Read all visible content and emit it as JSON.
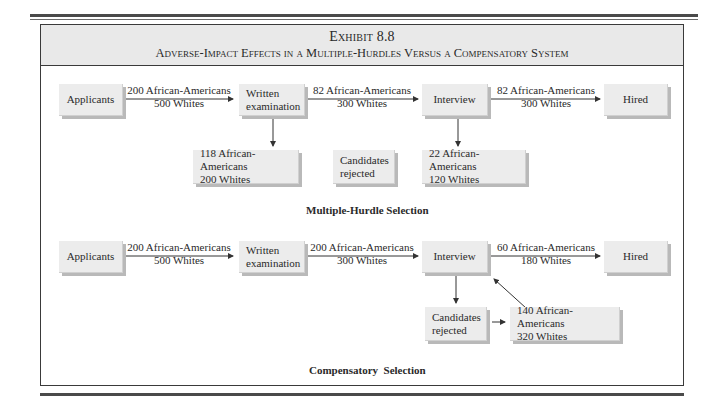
{
  "exhibit": {
    "number": "Exhibit 8.8",
    "title": "Adverse-Impact Effects in a Multiple-Hurdles Versus a Compensatory System"
  },
  "multiple_hurdle": {
    "caption": "Multiple-Hurdle Selection",
    "boxes": {
      "applicants": "Applicants",
      "written_line1": "Written",
      "written_line2": "examination",
      "interview": "Interview",
      "hired": "Hired",
      "rejected_written_line1": "118 African-Americans",
      "rejected_written_line2": "200 Whites",
      "candidates_line1": "Candidates",
      "candidates_line2": "rejected",
      "rejected_interview_line1": "22 African-Americans",
      "rejected_interview_line2": "120 Whites"
    },
    "flows": [
      {
        "line1": "200 African-Americans",
        "line2": "500 Whites"
      },
      {
        "line1": "82 African-Americans",
        "line2": "300 Whites"
      },
      {
        "line1": "82 African-Americans",
        "line2": "300 Whites"
      }
    ]
  },
  "compensatory": {
    "caption": "Compensatory  Selection",
    "boxes": {
      "applicants": "Applicants",
      "written_line1": "Written",
      "written_line2": "examination",
      "interview": "Interview",
      "hired": "Hired",
      "candidates_line1": "Candidates",
      "candidates_line2": "rejected",
      "rejected_line1": "140 African-Americans",
      "rejected_line2": "320 Whites"
    },
    "flows": [
      {
        "line1": "200 African-Americans",
        "line2": "500 Whites"
      },
      {
        "line1": "200 African-Americans",
        "line2": "300 Whites"
      },
      {
        "line1": "60 African-Americans",
        "line2": "180 Whites"
      }
    ]
  }
}
